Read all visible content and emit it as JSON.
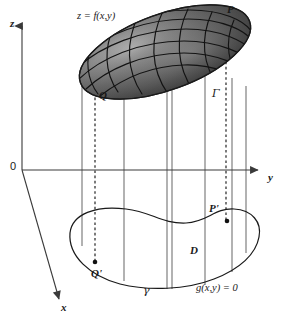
{
  "figure": {
    "background_color": "#ffffff",
    "ink_color": "#1a1a1a",
    "width": 286,
    "height": 324
  },
  "axes": {
    "z_label": "z",
    "y_label": "y",
    "x_label": "x",
    "origin_label": "0"
  },
  "labels": {
    "surface_equation": "z = f(x,y)",
    "point_p": "P",
    "point_q": "Q",
    "point_p_prime": "P'",
    "point_q_prime": "Q'",
    "curve_gamma_upper": "Γ",
    "curve_gamma_lower": "γ",
    "region_d": "D",
    "constraint_equation": "g(x,y) = 0"
  },
  "colors": {
    "surface_dark": "#3c3c3c",
    "surface_mid": "#5e5e5e",
    "surface_light": "#a8a8a8",
    "surface_highlight": "#d0d0d0",
    "mesh_line": "#141414",
    "rule_line": "#4a4a4a",
    "dashed_line": "#1a1a1a",
    "axis_line": "#3a3a3a",
    "curve_line": "#1a1a1a"
  },
  "geometry": {
    "origin": {
      "x": 22,
      "y": 170
    },
    "z_axis_top": {
      "x": 22,
      "y": 22
    },
    "y_axis_right": {
      "x": 262,
      "y": 170
    },
    "x_axis_end": {
      "x": 62,
      "y": 304
    },
    "surface_center": {
      "x": 165,
      "y": 52
    },
    "surface_rx": 90,
    "surface_ry": 38,
    "surface_rotation_deg": -20,
    "vertical_rulings_x": [
      82,
      124,
      167,
      172,
      205,
      232,
      246
    ],
    "dashed_verticals_x": [
      95,
      226
    ],
    "point_p_prime_dot": {
      "x": 227,
      "y": 221
    },
    "point_q_prime_dot": {
      "x": 95,
      "y": 262
    }
  }
}
